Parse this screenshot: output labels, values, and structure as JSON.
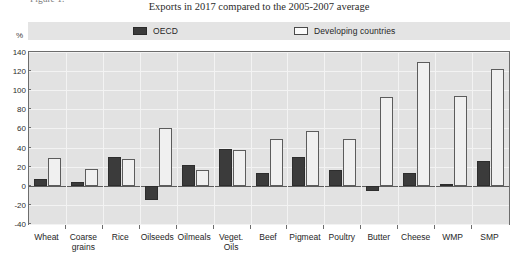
{
  "figure": {
    "caption_cut": "Figure 1.",
    "unit_label": "%"
  },
  "chart_data": {
    "type": "bar",
    "title": "Exports in 2017 compared to the 2005-2007 average",
    "xlabel": "",
    "ylabel": "%",
    "ylim": [
      -40,
      140
    ],
    "yticks": [
      -40,
      -20,
      0,
      20,
      40,
      60,
      80,
      100,
      120,
      140
    ],
    "ytick_labels": [
      "-40",
      "-20",
      "0",
      "20",
      "40",
      "60",
      "80",
      "100",
      "120",
      "140"
    ],
    "grid": true,
    "legend_position": "top",
    "categories": [
      "Wheat",
      "Coarse\ngrains",
      "Rice",
      "Oilseeds",
      "Oilmeals",
      "Veget.\nOils",
      "Beef",
      "Pigmeat",
      "Poultry",
      "Butter",
      "Cheese",
      "WMP",
      "SMP"
    ],
    "series": [
      {
        "name": "OECD",
        "color": "#3b3b3b",
        "values": [
          7,
          4,
          30,
          -15,
          22,
          39,
          13,
          30,
          17,
          -5,
          13,
          2,
          26
        ]
      },
      {
        "name": "Developing countries",
        "color": "#f0f0f0",
        "values": [
          29,
          18,
          28,
          60,
          17,
          37,
          49,
          57,
          49,
          93,
          130,
          94,
          122
        ]
      }
    ]
  },
  "legend": {
    "entries": [
      {
        "label": "OECD",
        "swatch": "filled-dark-square"
      },
      {
        "label": "Developing countries",
        "swatch": "outlined-white-square"
      }
    ]
  }
}
